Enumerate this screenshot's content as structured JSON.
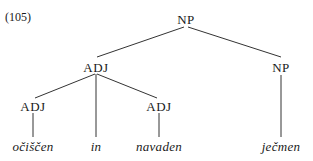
{
  "example_label": "(105)",
  "tree": {
    "root": {
      "label": "NP",
      "x": 186,
      "y": 19
    },
    "adj_phrase": {
      "label": "ADJ",
      "x": 96,
      "y": 67
    },
    "np_right": {
      "label": "NP",
      "x": 281,
      "y": 67
    },
    "adj_left": {
      "label": "ADJ",
      "x": 33,
      "y": 106
    },
    "adj_right": {
      "label": "ADJ",
      "x": 159,
      "y": 106
    },
    "leaves": [
      {
        "text": "očiščen",
        "x": 33,
        "y": 146
      },
      {
        "text": "in",
        "x": 96,
        "y": 146
      },
      {
        "text": "navaden",
        "x": 159,
        "y": 146
      },
      {
        "text": "ječmen",
        "x": 281,
        "y": 146
      }
    ]
  },
  "colors": {
    "line": "#333333",
    "text": "#1a1a1a"
  }
}
